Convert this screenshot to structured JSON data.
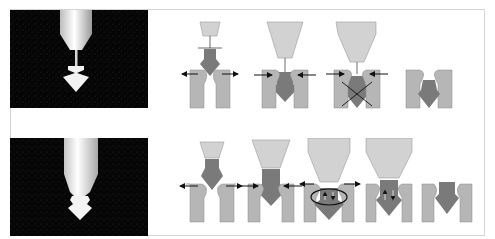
{
  "figure": {
    "colors": {
      "background": "#ffffff",
      "frame": "#d4d4d4",
      "photo_background": "#050505",
      "nozzle_fill": "#d2d2d2",
      "part_fill": "#7a7a7a",
      "wall_fill": "#b6b6b6",
      "arrow": "#111111"
    },
    "rows": [
      {
        "name": "top-row",
        "photo": "high-speed photograph of narrow nozzle with pinched arrow-shaped bead",
        "stages": [
          {
            "id": 1,
            "has_arrows": true,
            "arrows": "outward",
            "tool": "small"
          },
          {
            "id": 2,
            "has_arrows": true,
            "arrows": "inward",
            "tool": "large"
          },
          {
            "id": 3,
            "has_arrows": true,
            "arrows": "inward",
            "tool": "large",
            "mark": "cross"
          },
          {
            "id": 4,
            "has_arrows": false,
            "tool": "none"
          }
        ]
      },
      {
        "name": "bottom-row",
        "photo": "high-speed photograph of wide nozzle with short necked bead",
        "stages": [
          {
            "id": 1,
            "has_arrows": true,
            "arrows": "outward",
            "tool": "small"
          },
          {
            "id": 2,
            "has_arrows": true,
            "arrows": "inward",
            "tool": "large"
          },
          {
            "id": 3,
            "has_arrows": true,
            "arrows": "outward",
            "tool": "large",
            "mark": "ellipse"
          },
          {
            "id": 4,
            "has_arrows": false,
            "tool": "large",
            "mark": "internal-arrows"
          },
          {
            "id": 5,
            "has_arrows": false,
            "tool": "none"
          }
        ]
      }
    ]
  }
}
